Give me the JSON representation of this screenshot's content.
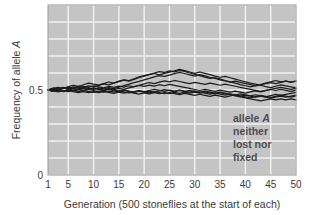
{
  "chart_data": {
    "type": "line",
    "title": "",
    "xlabel": "Generation (500 stoneflies at the start of each)",
    "ylabel": "Frequency of allele A",
    "ylabel_plain": "Frequency of allele ",
    "ylabel_italic": "A",
    "xlim": [
      1,
      50
    ],
    "ylim": [
      0,
      1
    ],
    "grid": true,
    "legend_position": "none",
    "plot_background": "#c4c4c4",
    "gridline_color": "#f2f2f2",
    "line_color": "#1c1c1c",
    "xticks": [
      1,
      5,
      10,
      15,
      20,
      25,
      30,
      35,
      40,
      45,
      50
    ],
    "xtick_labels": [
      "1",
      "5",
      "10",
      "15",
      "20",
      "25",
      "30",
      "35",
      "40",
      "45",
      "50"
    ],
    "yticks": [
      0,
      0.5
    ],
    "ytick_labels": [
      "0",
      "0.5"
    ],
    "y_gridlines": [
      0,
      0.1,
      0.2,
      0.3,
      0.4,
      0.5,
      0.6,
      0.7,
      0.8,
      0.9,
      1.0
    ],
    "annotation_lines": [
      "allele A",
      "neither",
      "lost nor",
      "fixed"
    ],
    "annotation_line1_plain": "allele ",
    "annotation_line1_italic": "A",
    "x": [
      1,
      2,
      3,
      4,
      5,
      6,
      7,
      8,
      9,
      10,
      11,
      12,
      13,
      14,
      15,
      16,
      17,
      18,
      19,
      20,
      21,
      22,
      23,
      24,
      25,
      26,
      27,
      28,
      29,
      30,
      31,
      32,
      33,
      34,
      35,
      36,
      37,
      38,
      39,
      40,
      41,
      42,
      43,
      44,
      45,
      46,
      47,
      48,
      49,
      50
    ],
    "series": [
      {
        "name": "population-1",
        "values": [
          0.5,
          0.508,
          0.515,
          0.509,
          0.52,
          0.528,
          0.522,
          0.531,
          0.54,
          0.534,
          0.529,
          0.538,
          0.547,
          0.541,
          0.552,
          0.56,
          0.555,
          0.566,
          0.578,
          0.585,
          0.592,
          0.6,
          0.608,
          0.603,
          0.612,
          0.607,
          0.615,
          0.609,
          0.6,
          0.592,
          0.585,
          0.576,
          0.568,
          0.572,
          0.565,
          0.556,
          0.548,
          0.54,
          0.532,
          0.525,
          0.518,
          0.525,
          0.532,
          0.54,
          0.548,
          0.556,
          0.548,
          0.552,
          0.546,
          0.552
        ]
      },
      {
        "name": "population-2",
        "values": [
          0.5,
          0.494,
          0.503,
          0.511,
          0.505,
          0.513,
          0.521,
          0.516,
          0.524,
          0.518,
          0.527,
          0.536,
          0.53,
          0.54,
          0.549,
          0.558,
          0.552,
          0.563,
          0.572,
          0.581,
          0.59,
          0.597,
          0.589,
          0.598,
          0.605,
          0.613,
          0.622,
          0.614,
          0.606,
          0.598,
          0.606,
          0.598,
          0.59,
          0.582,
          0.575,
          0.58,
          0.572,
          0.564,
          0.556,
          0.548,
          0.54,
          0.534,
          0.528,
          0.52,
          0.514,
          0.522,
          0.53,
          0.524,
          0.518,
          0.512
        ]
      },
      {
        "name": "population-3",
        "values": [
          0.5,
          0.51,
          0.504,
          0.512,
          0.506,
          0.498,
          0.507,
          0.516,
          0.51,
          0.503,
          0.512,
          0.506,
          0.514,
          0.508,
          0.517,
          0.526,
          0.534,
          0.543,
          0.551,
          0.56,
          0.568,
          0.577,
          0.585,
          0.58,
          0.588,
          0.596,
          0.604,
          0.597,
          0.589,
          0.582,
          0.59,
          0.583,
          0.575,
          0.568,
          0.56,
          0.553,
          0.546,
          0.552,
          0.545,
          0.538,
          0.531,
          0.524,
          0.53,
          0.537,
          0.544,
          0.538,
          0.545,
          0.552,
          0.546,
          0.552
        ]
      },
      {
        "name": "population-4",
        "values": [
          0.5,
          0.492,
          0.5,
          0.493,
          0.501,
          0.494,
          0.502,
          0.496,
          0.504,
          0.512,
          0.506,
          0.5,
          0.508,
          0.502,
          0.51,
          0.504,
          0.512,
          0.52,
          0.528,
          0.536,
          0.544,
          0.538,
          0.546,
          0.554,
          0.548,
          0.556,
          0.55,
          0.544,
          0.538,
          0.545,
          0.539,
          0.533,
          0.54,
          0.534,
          0.528,
          0.534,
          0.528,
          0.522,
          0.516,
          0.51,
          0.504,
          0.498,
          0.492,
          0.498,
          0.504,
          0.51,
          0.516,
          0.51,
          0.504,
          0.51
        ]
      },
      {
        "name": "population-5",
        "values": [
          0.5,
          0.496,
          0.489,
          0.496,
          0.49,
          0.497,
          0.491,
          0.498,
          0.492,
          0.486,
          0.493,
          0.487,
          0.494,
          0.488,
          0.495,
          0.489,
          0.483,
          0.49,
          0.496,
          0.49,
          0.497,
          0.504,
          0.498,
          0.492,
          0.499,
          0.493,
          0.5,
          0.494,
          0.488,
          0.494,
          0.488,
          0.482,
          0.476,
          0.482,
          0.476,
          0.47,
          0.476,
          0.47,
          0.464,
          0.47,
          0.464,
          0.458,
          0.464,
          0.458,
          0.452,
          0.458,
          0.464,
          0.458,
          0.464,
          0.47
        ]
      },
      {
        "name": "population-6",
        "values": [
          0.5,
          0.505,
          0.498,
          0.491,
          0.497,
          0.49,
          0.484,
          0.49,
          0.484,
          0.491,
          0.485,
          0.492,
          0.486,
          0.48,
          0.487,
          0.481,
          0.488,
          0.482,
          0.476,
          0.483,
          0.477,
          0.484,
          0.478,
          0.485,
          0.479,
          0.486,
          0.48,
          0.487,
          0.481,
          0.488,
          0.482,
          0.489,
          0.483,
          0.477,
          0.484,
          0.478,
          0.472,
          0.466,
          0.46,
          0.454,
          0.448,
          0.442,
          0.436,
          0.442,
          0.448,
          0.442,
          0.448,
          0.442,
          0.448,
          0.442
        ]
      },
      {
        "name": "population-7",
        "values": [
          0.5,
          0.493,
          0.5,
          0.494,
          0.501,
          0.508,
          0.502,
          0.509,
          0.503,
          0.51,
          0.504,
          0.498,
          0.505,
          0.499,
          0.493,
          0.5,
          0.494,
          0.488,
          0.495,
          0.489,
          0.483,
          0.49,
          0.484,
          0.478,
          0.485,
          0.479,
          0.473,
          0.48,
          0.474,
          0.468,
          0.475,
          0.469,
          0.463,
          0.47,
          0.464,
          0.458,
          0.465,
          0.472,
          0.466,
          0.46,
          0.454,
          0.461,
          0.468,
          0.462,
          0.456,
          0.463,
          0.47,
          0.464,
          0.458,
          0.465
        ]
      },
      {
        "name": "population-8",
        "values": [
          0.5,
          0.507,
          0.501,
          0.508,
          0.515,
          0.509,
          0.503,
          0.51,
          0.504,
          0.497,
          0.49,
          0.497,
          0.491,
          0.498,
          0.492,
          0.499,
          0.492,
          0.486,
          0.493,
          0.487,
          0.494,
          0.488,
          0.495,
          0.502,
          0.496,
          0.49,
          0.497,
          0.491,
          0.498,
          0.492,
          0.486,
          0.493,
          0.487,
          0.481,
          0.488,
          0.482,
          0.476,
          0.47,
          0.477,
          0.471,
          0.465,
          0.472,
          0.466,
          0.46,
          0.467,
          0.474,
          0.468,
          0.474,
          0.48,
          0.486
        ]
      },
      {
        "name": "population-9",
        "values": [
          0.5,
          0.512,
          0.506,
          0.516,
          0.51,
          0.519,
          0.513,
          0.522,
          0.516,
          0.525,
          0.519,
          0.513,
          0.521,
          0.515,
          0.523,
          0.517,
          0.525,
          0.519,
          0.527,
          0.521,
          0.529,
          0.523,
          0.531,
          0.525,
          0.533,
          0.527,
          0.521,
          0.515,
          0.509,
          0.503,
          0.497,
          0.504,
          0.498,
          0.492,
          0.499,
          0.493,
          0.487,
          0.494,
          0.488,
          0.482,
          0.489,
          0.495,
          0.489,
          0.496,
          0.503,
          0.497,
          0.504,
          0.498,
          0.492,
          0.499
        ]
      }
    ]
  }
}
